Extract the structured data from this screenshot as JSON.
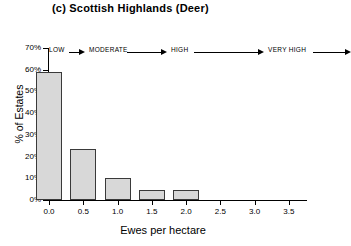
{
  "chart_data": {
    "type": "bar",
    "title": "(c) Scottish Highlands (Deer)",
    "xlabel": "Ewes per hectare",
    "ylabel": "% of Estates",
    "categories": [
      "0.0",
      "0.5",
      "1.0",
      "1.5",
      "2.0"
    ],
    "values": [
      59,
      23.5,
      10,
      4.5,
      4.5
    ],
    "x": [
      0.0,
      0.5,
      1.0,
      1.5,
      2.0
    ],
    "xlim": [
      0.0,
      3.75
    ],
    "ylim": [
      0,
      70
    ],
    "xticks": [
      "0.0",
      "0.5",
      "1.0",
      "1.5",
      "2.0",
      "2.5",
      "3.0",
      "3.5"
    ],
    "xtick_values": [
      0.0,
      0.5,
      1.0,
      1.5,
      2.0,
      2.5,
      3.0,
      3.5
    ],
    "yticks": [
      "0%",
      "10%",
      "20%",
      "30%",
      "40%",
      "50%",
      "60%",
      "70%"
    ],
    "ytick_values": [
      0,
      10,
      20,
      30,
      40,
      50,
      60,
      70
    ],
    "grid": false,
    "legend": false,
    "bar_fill_color": "#d8d8d8",
    "bar_edge_color": "#3a3a3a",
    "annotations": [
      {
        "label": "LOW"
      },
      {
        "label": "MODERATE"
      },
      {
        "label": "HIGH"
      },
      {
        "label": "VERY HIGH"
      }
    ]
  }
}
